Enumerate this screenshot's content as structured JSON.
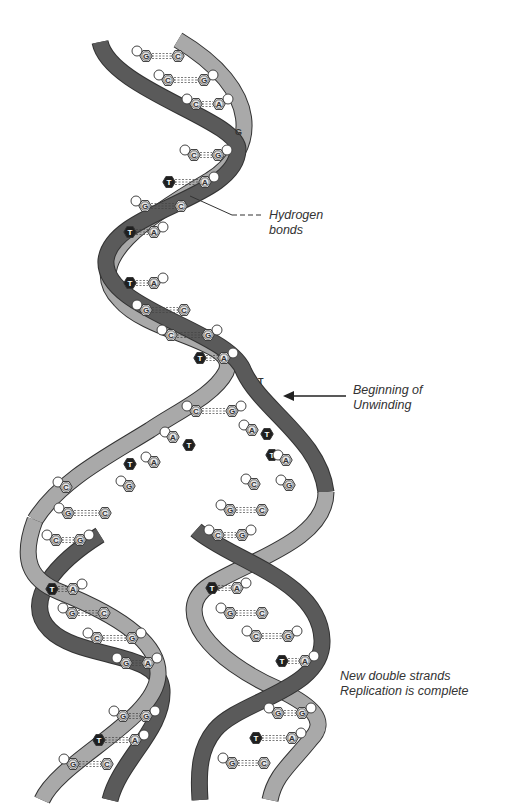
{
  "diagram": {
    "labels": {
      "hydrogen_bonds": {
        "line1": "Hydrogen",
        "line2": "bonds"
      },
      "unwinding": {
        "line1": "Beginning of",
        "line2": "Unwinding"
      },
      "complete": {
        "line1": "New double strands",
        "line2": "Replication is complete"
      }
    },
    "free_letters": {
      "top_g": "G",
      "mid_t": "T"
    },
    "colors": {
      "dark_strand": "#5a5a5a",
      "light_strand": "#a9a9a9",
      "strand_outline": "#333333",
      "base_fill": "#e6e6e6",
      "thymine_fill": "#1f1f1f",
      "text": "#333333"
    },
    "base_pairs_parent": [
      {
        "left": "G",
        "right": "C",
        "x1": 146,
        "x2": 178,
        "y": 56
      },
      {
        "left": "C",
        "right": "G",
        "x1": 168,
        "x2": 204,
        "y": 80
      },
      {
        "left": "C",
        "right": "A",
        "x1": 196,
        "x2": 219,
        "y": 104
      },
      {
        "left": "C",
        "right": "G",
        "x1": 194,
        "x2": 218,
        "y": 155
      },
      {
        "left": "T",
        "right": "A",
        "x1": 169,
        "x2": 205,
        "y": 182
      },
      {
        "left": "G",
        "right": "C",
        "x1": 145,
        "x2": 181,
        "y": 206
      },
      {
        "left": "T",
        "right": "A",
        "x1": 130,
        "x2": 154,
        "y": 232
      },
      {
        "left": "T",
        "right": "A",
        "x1": 130,
        "x2": 154,
        "y": 283
      },
      {
        "left": "G",
        "right": "C",
        "x1": 146,
        "x2": 184,
        "y": 310
      },
      {
        "left": "C",
        "right": "G",
        "x1": 171,
        "x2": 208,
        "y": 335
      },
      {
        "left": "T",
        "right": "A",
        "x1": 200,
        "x2": 224,
        "y": 358
      },
      {
        "left": "C",
        "right": "G",
        "x1": 196,
        "x2": 232,
        "y": 411
      }
    ],
    "unpaired_bases": [
      {
        "base": "A",
        "x": 173,
        "y": 437
      },
      {
        "base": "T",
        "x": 189,
        "y": 445
      },
      {
        "base": "T",
        "x": 130,
        "y": 464
      },
      {
        "base": "A",
        "x": 154,
        "y": 462
      },
      {
        "base": "G",
        "x": 129,
        "y": 486
      },
      {
        "base": "C",
        "x": 66,
        "y": 487
      },
      {
        "base": "A",
        "x": 252,
        "y": 430
      },
      {
        "base": "T",
        "x": 267,
        "y": 434
      },
      {
        "base": "T",
        "x": 272,
        "y": 455
      },
      {
        "base": "A",
        "x": 286,
        "y": 460
      },
      {
        "base": "C",
        "x": 254,
        "y": 484
      },
      {
        "base": "G",
        "x": 289,
        "y": 485
      }
    ],
    "base_pairs_left_daughter": [
      {
        "left": "G",
        "right": "C",
        "x1": 68,
        "x2": 105,
        "y": 513
      },
      {
        "left": "C",
        "right": "G",
        "x1": 56,
        "x2": 80,
        "y": 540
      },
      {
        "left": "T",
        "right": "A",
        "x1": 52,
        "x2": 73,
        "y": 589
      },
      {
        "left": "G",
        "right": "C",
        "x1": 72,
        "x2": 104,
        "y": 613
      },
      {
        "left": "C",
        "right": "G",
        "x1": 97,
        "x2": 132,
        "y": 638
      },
      {
        "left": "G",
        "right": "A",
        "x1": 126,
        "x2": 148,
        "y": 663
      },
      {
        "left": "G",
        "right": "G",
        "x1": 123,
        "x2": 146,
        "y": 716
      },
      {
        "left": "T",
        "right": "A",
        "x1": 99,
        "x2": 135,
        "y": 740
      },
      {
        "left": "G",
        "right": "C",
        "x1": 73,
        "x2": 107,
        "y": 764
      }
    ],
    "base_pairs_right_daughter": [
      {
        "left": "G",
        "right": "C",
        "x1": 230,
        "x2": 262,
        "y": 510
      },
      {
        "left": "C",
        "right": "G",
        "x1": 218,
        "x2": 242,
        "y": 535
      },
      {
        "left": "T",
        "right": "A",
        "x1": 212,
        "x2": 237,
        "y": 588
      },
      {
        "left": "G",
        "right": "C",
        "x1": 230,
        "x2": 262,
        "y": 613
      },
      {
        "left": "C",
        "right": "G",
        "x1": 256,
        "x2": 288,
        "y": 636
      },
      {
        "left": "T",
        "right": "A",
        "x1": 282,
        "x2": 305,
        "y": 661
      },
      {
        "left": "G",
        "right": "G",
        "x1": 278,
        "x2": 302,
        "y": 713
      },
      {
        "left": "T",
        "right": "A",
        "x1": 256,
        "x2": 292,
        "y": 738
      },
      {
        "left": "G",
        "right": "C",
        "x1": 232,
        "x2": 264,
        "y": 763
      }
    ]
  }
}
